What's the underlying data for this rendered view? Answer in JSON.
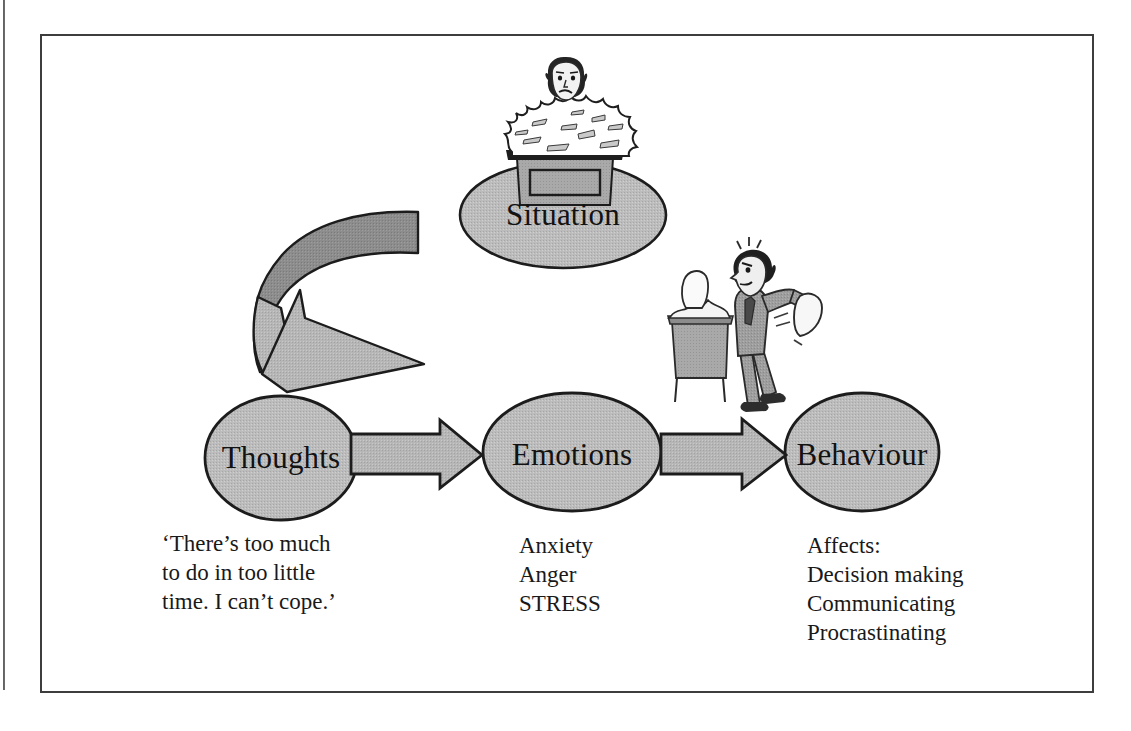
{
  "diagram": {
    "nodes": [
      {
        "id": "situation",
        "label": "Situation"
      },
      {
        "id": "thoughts",
        "label": "Thoughts"
      },
      {
        "id": "emotions",
        "label": "Emotions"
      },
      {
        "id": "behaviour",
        "label": "Behaviour"
      }
    ],
    "captions": {
      "thoughts": "‘There’s too much\nto do in too little\ntime. I can’t cope.’",
      "emotions": "Anxiety\nAnger\nSTRESS",
      "behaviour": "Affects:\nDecision making\nCommunicating\nProcrastinating"
    },
    "illustrations": {
      "situation": "person-buried-in-paperwork-at-desk",
      "behaviour": "man-throwing-papers-off-desk"
    },
    "arrows": [
      {
        "id": "thoughts-to-emotions",
        "from": "thoughts",
        "to": "emotions",
        "shape": "block-arrow-right"
      },
      {
        "id": "emotions-to-behaviour",
        "from": "emotions",
        "to": "behaviour",
        "shape": "block-arrow-right"
      },
      {
        "id": "feedback-loop",
        "from": "situation",
        "to": "thoughts",
        "shape": "curved-u-turn-arrow-left"
      }
    ],
    "colors": {
      "node_fill": "#b8b8b8",
      "node_stroke": "#1c1c1c",
      "arrow_fill": "#b5b5b5",
      "arrow_fill_dark": "#8a8a8a",
      "arrow_stroke": "#1c1c1c",
      "text": "#191919",
      "frame": "#3d3d3d",
      "page_background": "#ffffff"
    }
  }
}
